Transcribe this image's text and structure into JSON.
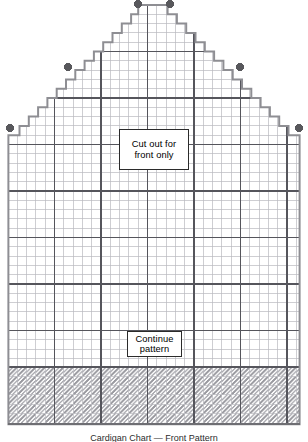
{
  "document": {
    "type": "knitting-chart",
    "caption": "Cardigan Chart — Front Pattern",
    "caption_clipped": true
  },
  "canvas": {
    "width": 308,
    "height": 442
  },
  "colors": {
    "background": "#ffffff",
    "grid_minor": "#b9b9bf",
    "grid_major": "#55555c",
    "outline": "#8e8e93",
    "marker": "#58585c",
    "symbol": "#9a9aa0",
    "border": "#6e6e73",
    "text": "#000000"
  },
  "grid": {
    "cell_size": 9.3,
    "origin_x": 8,
    "origin_y": 5,
    "columns": 31,
    "rows": 45,
    "major_every": 5,
    "minor_line_width": 0.7,
    "major_line_width": 1.25
  },
  "shape": {
    "name": "stepped-gable-silhouette",
    "description": "Stepped pentagon body with shaped shoulders rising to a narrow peak",
    "body_left_col": 0,
    "body_right_col": 31,
    "body_bottom_row": 45,
    "outline_width": 2,
    "steps": [
      {
        "row": 0,
        "left_col": 14,
        "right_col": 17
      },
      {
        "row": 1,
        "left_col": 13,
        "right_col": 18
      },
      {
        "row": 2,
        "left_col": 12,
        "right_col": 19
      },
      {
        "row": 3,
        "left_col": 11,
        "right_col": 20
      },
      {
        "row": 4,
        "left_col": 10,
        "right_col": 21
      },
      {
        "row": 5,
        "left_col": 9,
        "right_col": 22
      },
      {
        "row": 6,
        "left_col": 8,
        "right_col": 23
      },
      {
        "row": 7,
        "left_col": 7,
        "right_col": 24
      },
      {
        "row": 8,
        "left_col": 6,
        "right_col": 25
      },
      {
        "row": 9,
        "left_col": 5,
        "right_col": 26
      },
      {
        "row": 10,
        "left_col": 4,
        "right_col": 27
      },
      {
        "row": 11,
        "left_col": 3,
        "right_col": 28
      },
      {
        "row": 12,
        "left_col": 2,
        "right_col": 29
      },
      {
        "row": 13,
        "left_col": 1,
        "right_col": 30
      },
      {
        "row": 14,
        "left_col": 0,
        "right_col": 31
      }
    ]
  },
  "markers": {
    "label": "placement-dot",
    "radius": 4,
    "count": 6,
    "points": [
      {
        "x": 138,
        "y": 4
      },
      {
        "x": 170,
        "y": 4
      },
      {
        "x": 68,
        "y": 67
      },
      {
        "x": 240,
        "y": 67
      },
      {
        "x": 10,
        "y": 128
      },
      {
        "x": 299,
        "y": 128
      }
    ]
  },
  "ribbing": {
    "label": "ribbing-band",
    "top_row": 39,
    "bottom_row": 45,
    "symbol": "diagonal-slash",
    "rows": 6,
    "columns": 31
  },
  "notes": {
    "cutout": {
      "line1": "Cut out for",
      "line2": "front only"
    },
    "continue": {
      "line1": "Continue",
      "line2": "pattern"
    }
  }
}
